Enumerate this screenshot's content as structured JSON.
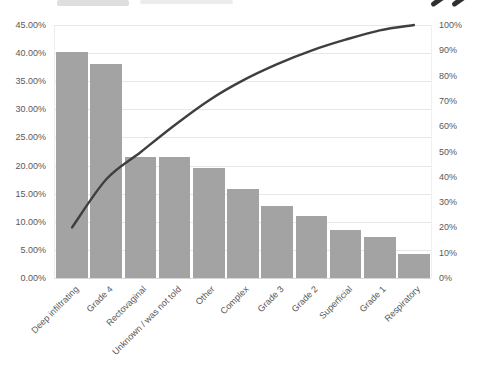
{
  "chart_data": {
    "type": "bar",
    "subtype": "pareto-combo",
    "title": "",
    "categories": [
      "Deep infiltrating",
      "Grade 4",
      "Rectovaginal",
      "Unknown / was not told",
      "Other",
      "Complex",
      "Grade 3",
      "Grade 2",
      "Superficial",
      "Grade 1",
      "Respiratory"
    ],
    "series": [
      {
        "name": "response-share-bars",
        "type": "bar",
        "axis": "left",
        "values": [
          40.2,
          38.0,
          21.5,
          21.5,
          19.6,
          15.9,
          12.8,
          11.0,
          8.6,
          7.3,
          4.3
        ]
      },
      {
        "name": "cumulative-percentage-line",
        "type": "line",
        "axis": "right",
        "values": [
          20.0,
          39.0,
          49.7,
          60.4,
          70.2,
          78.1,
          84.5,
          89.9,
          94.2,
          97.9,
          100.0
        ]
      }
    ],
    "left_axis": {
      "min": 0,
      "max": 45,
      "step": 5,
      "tick_format": "0.00%",
      "ticks": [
        "45.00%",
        "40.00%",
        "35.00%",
        "30.00%",
        "25.00%",
        "20.00%",
        "15.00%",
        "10.00%",
        "5.00%",
        "0.00%"
      ]
    },
    "right_axis": {
      "min": 0,
      "max": 100,
      "step": 10,
      "tick_format": "0%",
      "ticks": [
        "100%",
        "90%",
        "80%",
        "70%",
        "60%",
        "50%",
        "40%",
        "30%",
        "20%",
        "10%",
        "0%"
      ]
    },
    "grid": true,
    "legend": "none",
    "colors": {
      "bar": "#a3a3a3",
      "line": "#3f3f3f",
      "gridline": "#e7e7e7",
      "axis_line": "#d6d6d6",
      "tick_text": "#595959",
      "category_text": "#595959"
    }
  },
  "decor": {
    "quote_mark_color": "#2f2f2f",
    "remnant_color_1": "#dedede",
    "remnant_color_2": "#ececec"
  }
}
